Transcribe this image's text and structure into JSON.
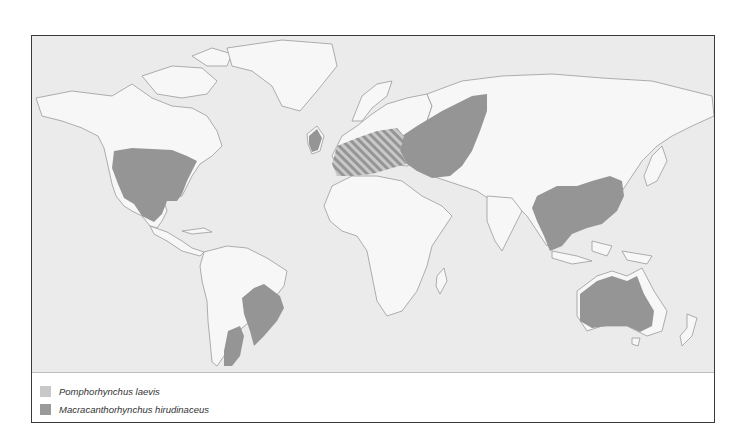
{
  "map": {
    "type": "world-distribution-map",
    "colors": {
      "ocean": "#ebebeb",
      "land": "#f7f7f7",
      "coastline": "#9a9a9a",
      "pomphorhynchus": "#c8c8c8",
      "macracanthorhynchus": "#959595"
    },
    "regions": [
      {
        "name": "North America (USA, Mexico)",
        "species": "Macracanthorhynchus hirudinaceus"
      },
      {
        "name": "South America (Brazil)",
        "species": "Macracanthorhynchus hirudinaceus"
      },
      {
        "name": "South America (Argentina)",
        "species": "Macracanthorhynchus hirudinaceus"
      },
      {
        "name": "Western Europe",
        "species": "Pomphorhynchus laevis + Macracanthorhynchus hirudinaceus (hatched)"
      },
      {
        "name": "Eastern Europe / Russia",
        "species": "Macracanthorhynchus hirudinaceus"
      },
      {
        "name": "China",
        "species": "Macracanthorhynchus hirudinaceus"
      },
      {
        "name": "Australia",
        "species": "Macracanthorhynchus hirudinaceus"
      }
    ]
  },
  "legend": {
    "items": [
      {
        "label": "Pomphorhynchus laevis",
        "color": "#c8c8c8"
      },
      {
        "label": "Macracanthorhynchus hirudinaceus",
        "color": "#9a9a9a"
      }
    ]
  }
}
